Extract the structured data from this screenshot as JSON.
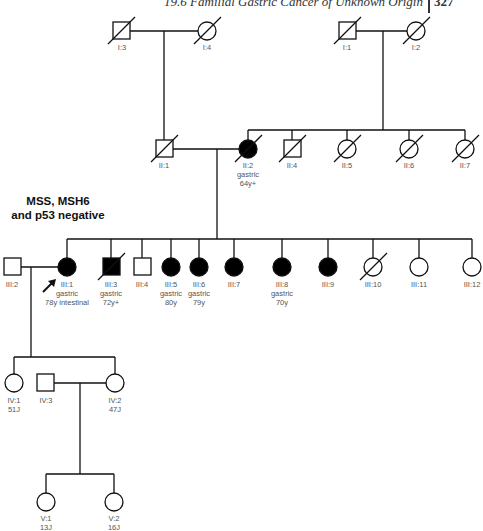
{
  "header": {
    "running_title": "19.6  Familial Gastric Cancer of Unknown Origin",
    "page_number": "327"
  },
  "annotation": {
    "line1": "MSS, MSH6",
    "line2": "and p53 negative"
  },
  "colors": {
    "line": "#111111",
    "affected_fill": "#000000",
    "unaffected_fill": "#ffffff",
    "label_text": "#555555"
  },
  "legend_semantics": {
    "square": "male",
    "circle": "female",
    "filled": "affected (gastric cancer)",
    "slash": "deceased",
    "arrow": "proband"
  },
  "pedigree": {
    "generations": [
      "I",
      "II",
      "III",
      "IV",
      "V"
    ],
    "individuals": {
      "I1": {
        "id": "I:1",
        "sex": "male",
        "affected": false,
        "deceased": true,
        "lines": []
      },
      "I2": {
        "id": "I:2",
        "sex": "female",
        "affected": false,
        "deceased": true,
        "lines": []
      },
      "I3": {
        "id": "I:3",
        "sex": "male",
        "affected": false,
        "deceased": true,
        "lines": []
      },
      "I4": {
        "id": "I:4",
        "sex": "female",
        "affected": false,
        "deceased": true,
        "lines": []
      },
      "II1": {
        "id": "II:1",
        "sex": "male",
        "affected": false,
        "deceased": true,
        "lines": []
      },
      "II2": {
        "id": "II:2",
        "sex": "female",
        "affected": true,
        "deceased": true,
        "lines": [
          "gastric",
          "64y+"
        ]
      },
      "II4": {
        "id": "II:4",
        "sex": "male",
        "affected": false,
        "deceased": true,
        "lines": []
      },
      "II5": {
        "id": "II:5",
        "sex": "female",
        "affected": false,
        "deceased": true,
        "lines": []
      },
      "II6": {
        "id": "II:6",
        "sex": "female",
        "affected": false,
        "deceased": true,
        "lines": []
      },
      "II7": {
        "id": "II:7",
        "sex": "female",
        "affected": false,
        "deceased": true,
        "lines": []
      },
      "III1": {
        "id": "III:1",
        "sex": "female",
        "affected": true,
        "deceased": false,
        "proband": true,
        "lines": [
          "gastric",
          "78y intestinal"
        ]
      },
      "III2": {
        "id": "III:2",
        "sex": "male",
        "affected": false,
        "deceased": false,
        "lines": []
      },
      "III3": {
        "id": "III:3",
        "sex": "male",
        "affected": true,
        "deceased": true,
        "lines": [
          "gastric",
          "72y+"
        ]
      },
      "III4": {
        "id": "III:4",
        "sex": "male",
        "affected": false,
        "deceased": false,
        "lines": []
      },
      "III5": {
        "id": "III:5",
        "sex": "female",
        "affected": true,
        "deceased": false,
        "lines": [
          "gastric",
          "80y"
        ]
      },
      "III6": {
        "id": "III:6",
        "sex": "female",
        "affected": true,
        "deceased": false,
        "lines": [
          "gastric",
          "79y"
        ]
      },
      "III7": {
        "id": "III:7",
        "sex": "female",
        "affected": true,
        "deceased": false,
        "lines": []
      },
      "III8": {
        "id": "III:8",
        "sex": "female",
        "affected": true,
        "deceased": false,
        "lines": [
          "gastric",
          "70y"
        ]
      },
      "III9": {
        "id": "III:9",
        "sex": "female",
        "affected": true,
        "deceased": false,
        "lines": []
      },
      "III10": {
        "id": "III:10",
        "sex": "female",
        "affected": false,
        "deceased": true,
        "lines": []
      },
      "III11": {
        "id": "III:11",
        "sex": "female",
        "affected": false,
        "deceased": false,
        "lines": []
      },
      "III12": {
        "id": "III:12",
        "sex": "female",
        "affected": false,
        "deceased": false,
        "lines": []
      },
      "IV1": {
        "id": "IV:1",
        "sex": "female",
        "affected": false,
        "deceased": false,
        "lines": [
          "51J"
        ]
      },
      "IV2": {
        "id": "IV:2",
        "sex": "female",
        "affected": false,
        "deceased": false,
        "lines": [
          "47J"
        ]
      },
      "IV3": {
        "id": "IV:3",
        "sex": "male",
        "affected": false,
        "deceased": false,
        "lines": []
      },
      "V1": {
        "id": "V:1",
        "sex": "female",
        "affected": false,
        "deceased": false,
        "lines": [
          "13J"
        ]
      },
      "V2": {
        "id": "V:2",
        "sex": "female",
        "affected": false,
        "deceased": false,
        "lines": [
          "16J"
        ]
      }
    },
    "couples": [
      {
        "partners": [
          "I3",
          "I4"
        ]
      },
      {
        "partners": [
          "I1",
          "I2"
        ]
      },
      {
        "partners": [
          "II1",
          "II2"
        ]
      },
      {
        "partners": [
          "III2",
          "III1"
        ]
      },
      {
        "partners": [
          "IV3",
          "IV2"
        ]
      }
    ]
  }
}
